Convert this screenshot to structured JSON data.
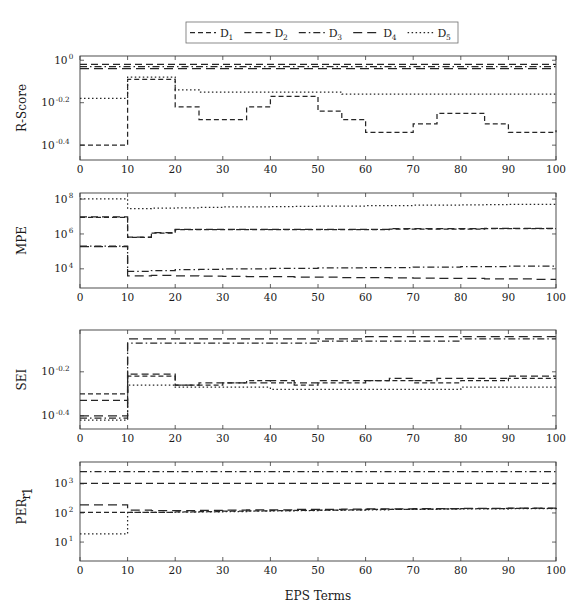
{
  "figure": {
    "xlabel": "EPS Terms",
    "legend": {
      "position": "top-center",
      "entries": [
        {
          "label": "D",
          "sub": "1",
          "dash": "5,3"
        },
        {
          "label": "D",
          "sub": "2",
          "dash": "7,4"
        },
        {
          "label": "D",
          "sub": "3",
          "dash": "7,3,1.5,3"
        },
        {
          "label": "D",
          "sub": "4",
          "dash": "9,5"
        },
        {
          "label": "D",
          "sub": "5",
          "dash": "1.5,2.5"
        }
      ]
    }
  },
  "chart_data": [
    {
      "type": "line",
      "title": "",
      "ylabel": "R-Score",
      "xlabel": "EPS Terms",
      "xlim": [
        0,
        100
      ],
      "xticks": [
        0,
        10,
        20,
        30,
        40,
        50,
        60,
        70,
        80,
        90,
        100
      ],
      "ylog_exponent_lim": [
        -0.47,
        0.02
      ],
      "yticks_exponents": [
        0,
        -0.2,
        -0.4
      ],
      "yticklabels": [
        "10^0",
        "10^-0.2",
        "10^-0.4"
      ],
      "grid": false,
      "x": [
        0,
        5,
        10,
        15,
        20,
        25,
        30,
        35,
        40,
        45,
        50,
        55,
        60,
        65,
        70,
        75,
        80,
        85,
        90,
        95,
        100
      ],
      "series": [
        {
          "name": "D1",
          "log_values": [
            -0.4,
            -0.4,
            -0.09,
            -0.09,
            -0.22,
            -0.28,
            -0.28,
            -0.22,
            -0.17,
            -0.17,
            -0.24,
            -0.28,
            -0.34,
            -0.34,
            -0.3,
            -0.25,
            -0.25,
            -0.3,
            -0.34,
            -0.34,
            -0.33
          ]
        },
        {
          "name": "D2",
          "log_values": [
            -0.02,
            -0.02,
            -0.02,
            -0.02,
            -0.02,
            -0.02,
            -0.02,
            -0.02,
            -0.02,
            -0.02,
            -0.02,
            -0.02,
            -0.02,
            -0.02,
            -0.02,
            -0.02,
            -0.02,
            -0.02,
            -0.02,
            -0.02,
            -0.02
          ]
        },
        {
          "name": "D3",
          "log_values": [
            -0.03,
            -0.03,
            -0.03,
            -0.03,
            -0.03,
            -0.03,
            -0.03,
            -0.03,
            -0.03,
            -0.03,
            -0.03,
            -0.03,
            -0.03,
            -0.03,
            -0.03,
            -0.03,
            -0.03,
            -0.03,
            -0.03,
            -0.03,
            -0.03
          ]
        },
        {
          "name": "D4",
          "log_values": [
            -0.04,
            -0.04,
            -0.04,
            -0.04,
            -0.04,
            -0.04,
            -0.04,
            -0.04,
            -0.04,
            -0.04,
            -0.04,
            -0.04,
            -0.04,
            -0.04,
            -0.04,
            -0.04,
            -0.04,
            -0.04,
            -0.04,
            -0.04,
            -0.04
          ]
        },
        {
          "name": "D5",
          "log_values": [
            -0.18,
            -0.18,
            -0.08,
            -0.08,
            -0.14,
            -0.15,
            -0.15,
            -0.15,
            -0.15,
            -0.15,
            -0.15,
            -0.16,
            -0.16,
            -0.16,
            -0.16,
            -0.16,
            -0.16,
            -0.16,
            -0.16,
            -0.16,
            -0.16
          ]
        }
      ]
    },
    {
      "type": "line",
      "title": "",
      "ylabel": "MPE",
      "xlabel": "EPS Terms",
      "xlim": [
        0,
        100
      ],
      "xticks": [
        0,
        10,
        20,
        30,
        40,
        50,
        60,
        70,
        80,
        90,
        100
      ],
      "ylog_exponent_lim": [
        2.9,
        8.35
      ],
      "yticks_exponents": [
        8,
        6,
        4
      ],
      "yticklabels": [
        "10^8",
        "10^6",
        "10^4"
      ],
      "grid": false,
      "x": [
        0,
        5,
        10,
        15,
        20,
        25,
        30,
        35,
        40,
        45,
        50,
        55,
        60,
        65,
        70,
        75,
        80,
        85,
        90,
        95,
        100
      ],
      "series": [
        {
          "name": "D1",
          "log_values": [
            6.95,
            6.95,
            5.8,
            6.05,
            6.25,
            6.25,
            6.25,
            6.25,
            6.25,
            6.25,
            6.25,
            6.25,
            6.25,
            6.28,
            6.28,
            6.28,
            6.28,
            6.3,
            6.3,
            6.3,
            6.3
          ]
        },
        {
          "name": "D2",
          "log_values": [
            6.98,
            6.98,
            5.82,
            6.07,
            6.27,
            6.27,
            6.27,
            6.27,
            6.27,
            6.27,
            6.27,
            6.27,
            6.27,
            6.3,
            6.3,
            6.3,
            6.3,
            6.32,
            6.32,
            6.32,
            6.32
          ]
        },
        {
          "name": "D3",
          "log_values": [
            5.3,
            5.3,
            3.85,
            3.9,
            3.95,
            3.97,
            4.0,
            4.0,
            4.02,
            4.02,
            4.05,
            4.05,
            4.07,
            4.07,
            4.1,
            4.1,
            4.12,
            4.12,
            4.15,
            4.15,
            4.17
          ]
        },
        {
          "name": "D4",
          "log_values": [
            5.28,
            5.28,
            3.6,
            3.62,
            3.6,
            3.58,
            3.57,
            3.55,
            3.55,
            3.53,
            3.52,
            3.5,
            3.5,
            3.48,
            3.47,
            3.45,
            3.45,
            3.43,
            3.42,
            3.4,
            3.4
          ]
        },
        {
          "name": "D5",
          "log_values": [
            8.02,
            8.02,
            7.45,
            7.48,
            7.5,
            7.52,
            7.55,
            7.55,
            7.57,
            7.58,
            7.6,
            7.6,
            7.62,
            7.63,
            7.65,
            7.65,
            7.67,
            7.68,
            7.7,
            7.7,
            7.72
          ]
        }
      ]
    },
    {
      "type": "line",
      "title": "",
      "ylabel": "SEI",
      "xlabel": "EPS Terms",
      "xlim": [
        0,
        100
      ],
      "xticks": [
        0,
        10,
        20,
        30,
        40,
        50,
        60,
        70,
        80,
        90,
        100
      ],
      "ylog_exponent_lim": [
        -0.46,
        -0.01
      ],
      "yticks_exponents": [
        -0.2,
        -0.4
      ],
      "yticklabels": [
        "10^-0.2",
        "10^-0.4"
      ],
      "grid": false,
      "x": [
        0,
        5,
        10,
        15,
        20,
        25,
        30,
        35,
        40,
        45,
        50,
        55,
        60,
        65,
        70,
        75,
        80,
        85,
        90,
        95,
        100
      ],
      "series": [
        {
          "name": "D1",
          "log_values": [
            -0.3,
            -0.3,
            -0.22,
            -0.22,
            -0.26,
            -0.26,
            -0.25,
            -0.24,
            -0.25,
            -0.26,
            -0.25,
            -0.25,
            -0.24,
            -0.24,
            -0.25,
            -0.25,
            -0.24,
            -0.24,
            -0.23,
            -0.23,
            -0.23
          ]
        },
        {
          "name": "D2",
          "log_values": [
            -0.33,
            -0.33,
            -0.21,
            -0.21,
            -0.26,
            -0.25,
            -0.25,
            -0.25,
            -0.24,
            -0.25,
            -0.24,
            -0.24,
            -0.24,
            -0.23,
            -0.24,
            -0.23,
            -0.23,
            -0.23,
            -0.22,
            -0.22,
            -0.22
          ]
        },
        {
          "name": "D3",
          "log_values": [
            -0.41,
            -0.41,
            -0.07,
            -0.07,
            -0.07,
            -0.07,
            -0.07,
            -0.07,
            -0.07,
            -0.07,
            -0.06,
            -0.06,
            -0.06,
            -0.06,
            -0.06,
            -0.06,
            -0.05,
            -0.05,
            -0.05,
            -0.05,
            -0.05
          ]
        },
        {
          "name": "D4",
          "log_values": [
            -0.4,
            -0.4,
            -0.05,
            -0.05,
            -0.05,
            -0.05,
            -0.05,
            -0.05,
            -0.05,
            -0.05,
            -0.05,
            -0.05,
            -0.04,
            -0.04,
            -0.04,
            -0.04,
            -0.04,
            -0.04,
            -0.04,
            -0.04,
            -0.04
          ]
        },
        {
          "name": "D5",
          "log_values": [
            -0.42,
            -0.42,
            -0.26,
            -0.26,
            -0.27,
            -0.27,
            -0.27,
            -0.27,
            -0.28,
            -0.28,
            -0.28,
            -0.28,
            -0.28,
            -0.28,
            -0.28,
            -0.28,
            -0.27,
            -0.27,
            -0.27,
            -0.27,
            -0.27
          ]
        }
      ]
    },
    {
      "type": "line",
      "title": "",
      "ylabel": "PER",
      "ylabel_sub": "r1",
      "xlabel": "EPS Terms",
      "xlim": [
        0,
        100
      ],
      "xticks": [
        0,
        10,
        20,
        30,
        40,
        50,
        60,
        70,
        80,
        90,
        100
      ],
      "ylog_exponent_lim": [
        0.35,
        3.75
      ],
      "yticks_exponents": [
        3,
        2,
        1
      ],
      "yticklabels": [
        "10^3",
        "10^2",
        "10^1"
      ],
      "grid": false,
      "x": [
        0,
        5,
        10,
        15,
        20,
        25,
        30,
        35,
        40,
        45,
        50,
        55,
        60,
        65,
        70,
        75,
        80,
        85,
        90,
        95,
        100
      ],
      "series": [
        {
          "name": "D1",
          "log_values": [
            2.02,
            2.02,
            2.02,
            2.02,
            2.04,
            2.05,
            2.06,
            2.07,
            2.08,
            2.09,
            2.1,
            2.11,
            2.12,
            2.12,
            2.13,
            2.14,
            2.15,
            2.15,
            2.16,
            2.16,
            2.17
          ]
        },
        {
          "name": "D2",
          "log_values": [
            3.02,
            3.02,
            3.02,
            3.02,
            3.02,
            3.02,
            3.02,
            3.02,
            3.02,
            3.02,
            3.02,
            3.02,
            3.02,
            3.02,
            3.02,
            3.02,
            3.02,
            3.02,
            3.02,
            3.02,
            3.02
          ]
        },
        {
          "name": "D3",
          "log_values": [
            3.42,
            3.42,
            3.42,
            3.42,
            3.42,
            3.42,
            3.42,
            3.42,
            3.42,
            3.42,
            3.42,
            3.42,
            3.42,
            3.42,
            3.42,
            3.42,
            3.42,
            3.42,
            3.42,
            3.42,
            3.42
          ]
        },
        {
          "name": "D4",
          "log_values": [
            2.28,
            2.28,
            2.1,
            2.08,
            2.08,
            2.09,
            2.1,
            2.11,
            2.11,
            2.12,
            2.12,
            2.13,
            2.14,
            2.14,
            2.15,
            2.15,
            2.16,
            2.16,
            2.17,
            2.17,
            2.18
          ]
        },
        {
          "name": "D5",
          "log_values": [
            1.28,
            1.28,
            2.02,
            2.02,
            2.03,
            2.04,
            2.05,
            2.06,
            2.07,
            2.08,
            2.09,
            2.1,
            2.11,
            2.12,
            2.12,
            2.13,
            2.14,
            2.14,
            2.15,
            2.15,
            2.16
          ]
        }
      ]
    }
  ]
}
